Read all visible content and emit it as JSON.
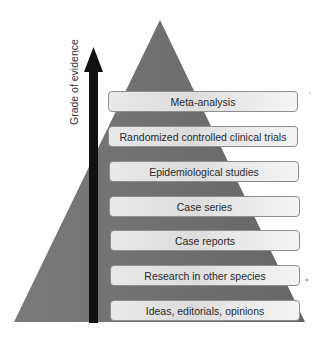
{
  "figure": {
    "axis_label": "Grade of evidence",
    "tiers": [
      {
        "label": "Meta-analysis"
      },
      {
        "label": "Randomized controlled clinical trials"
      },
      {
        "label": "Epidemiological studies"
      },
      {
        "label": "Case series"
      },
      {
        "label": "Case reports"
      },
      {
        "label": "Research in other species"
      },
      {
        "label": "Ideas, editorials, opinions"
      }
    ],
    "colors": {
      "pyramid": "#6f6f6f",
      "arrow": "#111111",
      "tier_fill": "#e4e4e4",
      "tier_border": "#8e8e8e"
    }
  }
}
